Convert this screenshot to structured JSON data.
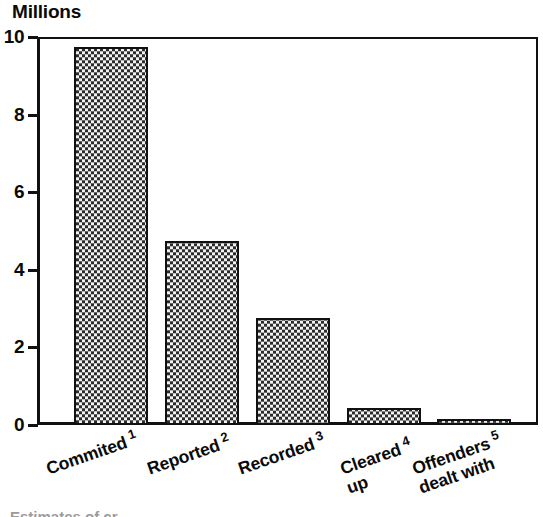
{
  "chart_data": {
    "type": "bar",
    "title": "Millions",
    "xlabel": "",
    "ylabel": "Millions",
    "ylim": [
      0,
      10
    ],
    "yticks": [
      0,
      2,
      4,
      6,
      8,
      10
    ],
    "grid": false,
    "legend": "none",
    "categories": [
      "Commited",
      "Reported",
      "Recorded",
      "Cleared up",
      "Offenders dealt with"
    ],
    "category_notes": [
      "1",
      "2",
      "3",
      "4",
      "5"
    ],
    "values": [
      9.75,
      4.75,
      2.75,
      0.45,
      0.15
    ],
    "units": "millions"
  },
  "chart": {
    "axis_title": "Millions",
    "y_ticks": [
      {
        "label": "10",
        "value": 10
      },
      {
        "label": "8",
        "value": 8
      },
      {
        "label": "6",
        "value": 6
      },
      {
        "label": "4",
        "value": 4
      },
      {
        "label": "2",
        "value": 2
      },
      {
        "label": "0",
        "value": 0
      }
    ],
    "bars": [
      {
        "label_line1": "Commited",
        "label_line2": "",
        "note": "1",
        "value": 9.75
      },
      {
        "label_line1": "Reported",
        "label_line2": "",
        "note": "2",
        "value": 4.75
      },
      {
        "label_line1": "Recorded",
        "label_line2": "",
        "note": "3",
        "value": 2.75
      },
      {
        "label_line1": "Cleared",
        "label_line2": "up",
        "note": "4",
        "value": 0.45
      },
      {
        "label_line1": "Offenders",
        "label_line2": "dealt with",
        "note": "5",
        "value": 0.15
      }
    ],
    "colors": {
      "axis": "#111111",
      "bar_outline": "#111111",
      "bar_fill_dark": "#2b2b2b",
      "bar_fill_light": "#f2f2f2",
      "background": "#ffffff"
    },
    "bottom_caption": "Estimates of cr"
  }
}
